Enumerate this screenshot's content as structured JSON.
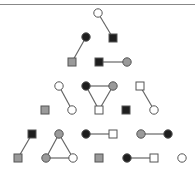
{
  "diagram": {
    "type": "graph-pyramid",
    "colors": {
      "white": "#ffffff",
      "gray": "#9a9a9a",
      "black": "#1e1e1e",
      "stroke": "#555555",
      "edge": "#666666",
      "border": "#888888"
    },
    "nodes": [
      {
        "id": "n1",
        "shape": "circle",
        "fill": "white",
        "x": 98,
        "y": 13
      },
      {
        "id": "n2",
        "shape": "square",
        "fill": "black",
        "x": 113,
        "y": 38
      },
      {
        "id": "n3",
        "shape": "circle",
        "fill": "black",
        "x": 86,
        "y": 37
      },
      {
        "id": "n4",
        "shape": "square",
        "fill": "gray",
        "x": 72,
        "y": 62
      },
      {
        "id": "n5",
        "shape": "square",
        "fill": "black",
        "x": 99,
        "y": 62
      },
      {
        "id": "n6",
        "shape": "circle",
        "fill": "gray",
        "x": 127,
        "y": 62
      },
      {
        "id": "n7",
        "shape": "circle",
        "fill": "white",
        "x": 59,
        "y": 86
      },
      {
        "id": "n8",
        "shape": "circle",
        "fill": "black",
        "x": 86,
        "y": 86
      },
      {
        "id": "n9",
        "shape": "circle",
        "fill": "gray",
        "x": 113,
        "y": 86
      },
      {
        "id": "n10",
        "shape": "square",
        "fill": "white",
        "x": 140,
        "y": 86
      },
      {
        "id": "n11",
        "shape": "square",
        "fill": "gray",
        "x": 45,
        "y": 110
      },
      {
        "id": "n12",
        "shape": "circle",
        "fill": "white",
        "x": 72,
        "y": 110
      },
      {
        "id": "n13",
        "shape": "square",
        "fill": "white",
        "x": 99,
        "y": 110
      },
      {
        "id": "n14",
        "shape": "square",
        "fill": "black",
        "x": 126,
        "y": 110
      },
      {
        "id": "n15",
        "shape": "circle",
        "fill": "white",
        "x": 154,
        "y": 110
      },
      {
        "id": "n16",
        "shape": "square",
        "fill": "black",
        "x": 32,
        "y": 134
      },
      {
        "id": "n17",
        "shape": "circle",
        "fill": "gray",
        "x": 59,
        "y": 134
      },
      {
        "id": "n18",
        "shape": "circle",
        "fill": "black",
        "x": 86,
        "y": 134
      },
      {
        "id": "n19",
        "shape": "square",
        "fill": "white",
        "x": 113,
        "y": 134
      },
      {
        "id": "n20",
        "shape": "circle",
        "fill": "gray",
        "x": 141,
        "y": 134
      },
      {
        "id": "n21",
        "shape": "circle",
        "fill": "black",
        "x": 168,
        "y": 134
      },
      {
        "id": "n22",
        "shape": "square",
        "fill": "gray",
        "x": 18,
        "y": 158
      },
      {
        "id": "n23",
        "shape": "circle",
        "fill": "gray",
        "x": 46,
        "y": 158
      },
      {
        "id": "n24",
        "shape": "circle",
        "fill": "white",
        "x": 73,
        "y": 158
      },
      {
        "id": "n25",
        "shape": "square",
        "fill": "gray",
        "x": 99,
        "y": 158
      },
      {
        "id": "n26",
        "shape": "circle",
        "fill": "black",
        "x": 127,
        "y": 158
      },
      {
        "id": "n27",
        "shape": "square",
        "fill": "white",
        "x": 154,
        "y": 158
      },
      {
        "id": "n28",
        "shape": "circle",
        "fill": "white",
        "x": 182,
        "y": 158
      }
    ],
    "edges": [
      [
        "n1",
        "n2"
      ],
      [
        "n3",
        "n4"
      ],
      [
        "n5",
        "n6"
      ],
      [
        "n7",
        "n12"
      ],
      [
        "n8",
        "n9"
      ],
      [
        "n8",
        "n13"
      ],
      [
        "n9",
        "n13"
      ],
      [
        "n10",
        "n15"
      ],
      [
        "n16",
        "n22"
      ],
      [
        "n17",
        "n23"
      ],
      [
        "n17",
        "n24"
      ],
      [
        "n23",
        "n24"
      ],
      [
        "n18",
        "n19"
      ],
      [
        "n20",
        "n21"
      ],
      [
        "n26",
        "n27"
      ]
    ]
  }
}
